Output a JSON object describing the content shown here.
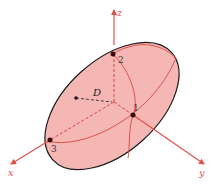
{
  "diagram": {
    "type": "ellipsoid-with-axes",
    "axes": {
      "x": {
        "label": "x"
      },
      "y": {
        "label": "y"
      },
      "z": {
        "label": "z"
      }
    },
    "points": [
      {
        "id": "1",
        "label": "1"
      },
      {
        "id": "2",
        "label": "2"
      },
      {
        "id": "3",
        "label": "3"
      }
    ],
    "distance_label": "D",
    "colors": {
      "axis": "#e0504a",
      "fill": "#f4b7b3",
      "outline": "#1a1a1a",
      "point": "#3a0a0a"
    }
  }
}
